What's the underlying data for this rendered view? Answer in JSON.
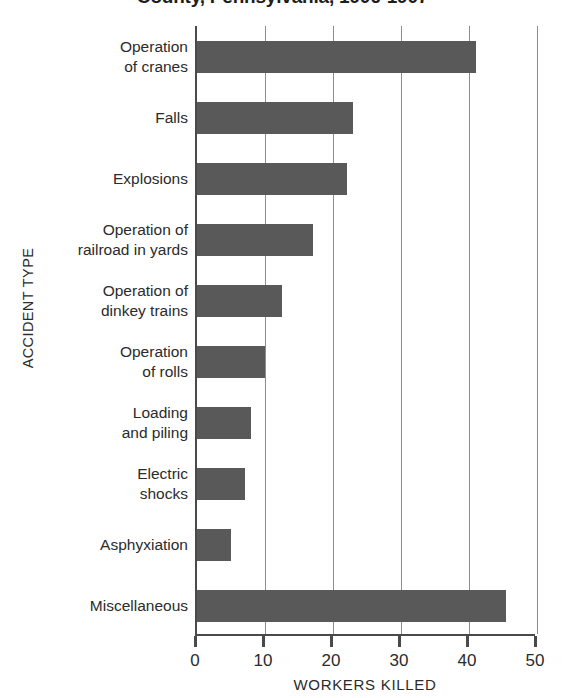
{
  "chart_data": {
    "type": "bar",
    "orientation": "horizontal",
    "title": "County, Pennsylvania, 1906-1907",
    "xlabel": "WORKERS KILLED",
    "ylabel": "ACCIDENT TYPE",
    "categories": [
      "Operation\nof cranes",
      "Falls",
      "Explosions",
      "Operation of\nrailroad in yards",
      "Operation of\ndinkey trains",
      "Operation\nof rolls",
      "Loading\nand piling",
      "Electric\nshocks",
      "Asphyxiation",
      "Miscellaneous"
    ],
    "category_lines": [
      [
        "Operation",
        "of cranes"
      ],
      [
        "Falls"
      ],
      [
        "Explosions"
      ],
      [
        "Operation of",
        "railroad in yards"
      ],
      [
        "Operation of",
        "dinkey trains"
      ],
      [
        "Operation",
        "of rolls"
      ],
      [
        "Loading",
        "and piling"
      ],
      [
        "Electric",
        "shocks"
      ],
      [
        "Asphyxiation"
      ],
      [
        "Miscellaneous"
      ]
    ],
    "values": [
      41,
      23,
      22,
      17,
      12.5,
      10,
      8,
      7,
      5,
      45.5
    ],
    "xlim": [
      0,
      50
    ],
    "xticks": [
      0,
      10,
      20,
      30,
      40,
      50
    ],
    "xtick_labels": [
      "0",
      "10",
      "20",
      "30",
      "40",
      "50"
    ],
    "grid": "vertical",
    "legend": "none",
    "bar_color": "#595959",
    "grid_color": "#8d8d8d",
    "axis_color": "#4a4a4a"
  }
}
